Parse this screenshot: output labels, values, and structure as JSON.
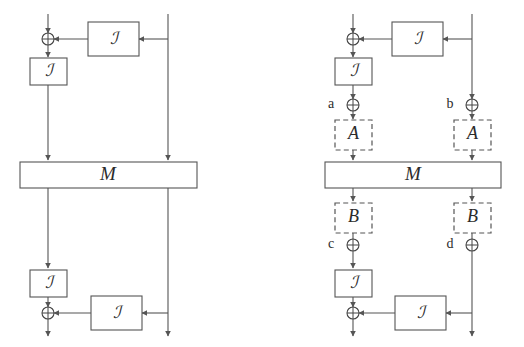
{
  "figure": {
    "type": "block-diagram",
    "background_color": "#ffffff",
    "line_color": "#555555",
    "text_color": "#2b2b2b"
  },
  "panels": [
    {
      "id": "left-panel",
      "name": "plain-round-diagram",
      "mix_label": "M",
      "transform_label": "ℐ",
      "blocks": [
        {
          "name": "top-feedback-transform",
          "label": "ℐ"
        },
        {
          "name": "top-left-transform",
          "label": "ℐ"
        },
        {
          "name": "mix-layer",
          "label": "M"
        },
        {
          "name": "bottom-left-transform",
          "label": "ℐ"
        },
        {
          "name": "bottom-feedback-transform",
          "label": "ℐ"
        }
      ],
      "xors": [
        {
          "name": "top-xor",
          "label": "",
          "symbol": "⊕"
        },
        {
          "name": "bottom-xor",
          "label": "",
          "symbol": "⊕"
        }
      ]
    },
    {
      "id": "right-panel",
      "name": "annotated-round-diagram",
      "mix_label": "M",
      "transform_label": "ℐ",
      "blocks": [
        {
          "name": "top-feedback-transform",
          "label": "ℐ"
        },
        {
          "name": "top-left-transform",
          "label": "ℐ"
        },
        {
          "name": "diff-a-left",
          "label": "A"
        },
        {
          "name": "diff-a-right",
          "label": "A"
        },
        {
          "name": "mix-layer",
          "label": "M"
        },
        {
          "name": "diff-b-left",
          "label": "B"
        },
        {
          "name": "diff-b-right",
          "label": "B"
        },
        {
          "name": "bottom-left-transform",
          "label": "ℐ"
        },
        {
          "name": "bottom-feedback-transform",
          "label": "ℐ"
        }
      ],
      "xors": [
        {
          "name": "top-xor",
          "label": "",
          "symbol": "⊕"
        },
        {
          "name": "xor-a",
          "label": "a",
          "symbol": "⊕"
        },
        {
          "name": "xor-b",
          "label": "b",
          "symbol": "⊕"
        },
        {
          "name": "xor-c",
          "label": "c",
          "symbol": "⊕"
        },
        {
          "name": "xor-d",
          "label": "d",
          "symbol": "⊕"
        },
        {
          "name": "bottom-xor",
          "label": "",
          "symbol": "⊕"
        }
      ]
    }
  ],
  "labels": {
    "script_i": "ℐ",
    "mix": "M",
    "diff_in": "A",
    "diff_out": "B",
    "tag_a": "a",
    "tag_b": "b",
    "tag_c": "c",
    "tag_d": "d",
    "xor": "⊕"
  }
}
